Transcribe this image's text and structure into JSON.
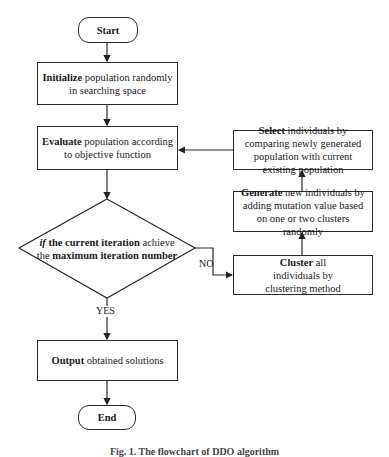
{
  "flowchart": {
    "start": {
      "label": "Start"
    },
    "initialize": {
      "keyword": "Initialize",
      "text": " population randomly in searching space"
    },
    "evaluate": {
      "keyword": "Evaluate",
      "text": " population according to objective function"
    },
    "decision": {
      "if": "if",
      "part1": " the current iteration",
      "part2": " achieve",
      "part3": "the",
      "part4": " maximum iteration number"
    },
    "select": {
      "keyword": "Select",
      "text": " individuals by comparing newly generated population with current existing population"
    },
    "generate": {
      "keyword": "Generate",
      "text": " new individuals by adding mutation value based on one or two clusters randomly"
    },
    "cluster": {
      "keyword": "Cluster",
      "text": " all individuals by clustering method"
    },
    "output": {
      "keyword": "Output",
      "text": " obtained solutions"
    },
    "end": {
      "label": "End"
    },
    "edge_labels": {
      "no": "NO",
      "yes": "YES"
    }
  },
  "caption": "Fig. 1. The flowchart of DDO algorithm"
}
